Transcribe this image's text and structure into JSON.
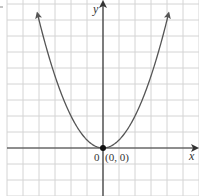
{
  "chart_data": {
    "type": "line",
    "title": "",
    "function": "y = x^2 / 2",
    "xlabel": "x",
    "ylabel": "y",
    "origin_label": "0",
    "annotations": [
      {
        "text": "(0, 0)",
        "x": 0,
        "y": 0,
        "marker": "dot"
      }
    ],
    "x": [
      -4,
      -3,
      -2,
      -1,
      0,
      1,
      2,
      3,
      4
    ],
    "values": [
      8,
      4.5,
      2,
      0.5,
      0,
      0.5,
      2,
      4.5,
      8
    ],
    "xlim": [
      -6,
      6
    ],
    "ylim": [
      -3,
      9
    ],
    "grid": true,
    "grid_spacing": 1,
    "curve_arrows": "both ends"
  },
  "colors": {
    "grid": "#d4d4d4",
    "axis": "#333333",
    "curve": "#555555",
    "point": "#111111"
  }
}
